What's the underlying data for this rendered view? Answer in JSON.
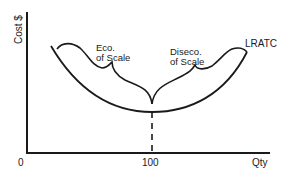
{
  "diagram": {
    "y_axis_label": "Cost $",
    "x_axis_label": "Qty",
    "origin_label": "0",
    "x_tick_label": "100",
    "curve_label": "LRATC",
    "brace_left_label_line1": "Eco.",
    "brace_left_label_line2": "of Scale",
    "brace_right_label_line1": "Diseco.",
    "brace_right_label_line2": "of Scale",
    "colors": {
      "ink": "#1a1a1a",
      "background": "#ffffff"
    }
  }
}
